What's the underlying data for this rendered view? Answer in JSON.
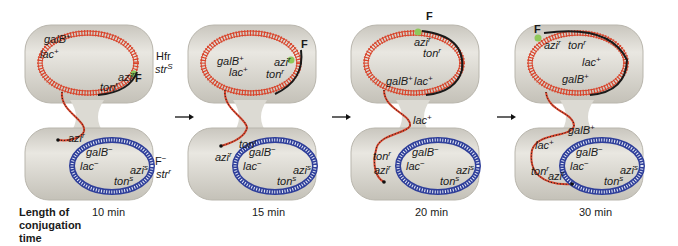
{
  "axis_label": [
    "Length of",
    "conjugation",
    "time"
  ],
  "donor_label": [
    "Hfr",
    "str",
    "S"
  ],
  "recipient_label": [
    "F",
    "−",
    "str",
    "r"
  ],
  "colors": {
    "cell_fill": "#d8d6cf",
    "cell_edge": "#b9b6ad",
    "hfr_dna": "#d9442b",
    "transferred_dna": "#1a1a1a",
    "f_factor": "#8fc85a",
    "recipient_dna": "#2f3f9a"
  },
  "panels": [
    {
      "time": "10 min",
      "donor_genes": [
        "galB+",
        "lac+",
        "azi r",
        "ton r",
        "F"
      ],
      "transferred_genes": [
        "azi r"
      ],
      "recipient_genes": [
        "galB−",
        "lac−",
        "azi s",
        "ton s"
      ]
    },
    {
      "time": "15 min",
      "donor_genes": [
        "galB+",
        "lac+",
        "azi r",
        "ton r",
        "F"
      ],
      "transferred_genes": [
        "ton r",
        "azi r"
      ],
      "recipient_genes": [
        "galB−",
        "lac−",
        "azi s",
        "ton s"
      ]
    },
    {
      "time": "20 min",
      "donor_genes": [
        "F",
        "azi r",
        "ton r",
        "galB+",
        "lac+"
      ],
      "transferred_genes": [
        "lac+",
        "ton r",
        "azi r"
      ],
      "recipient_genes": [
        "galB−",
        "lac−",
        "azi s",
        "ton s"
      ]
    },
    {
      "time": "30 min",
      "donor_genes": [
        "F",
        "azi r",
        "ton r",
        "lac+",
        "galB+"
      ],
      "transferred_genes": [
        "galB+",
        "lac+",
        "ton r",
        "azi r"
      ],
      "recipient_genes": [
        "galB−",
        "lac−",
        "azi s",
        "ton s"
      ]
    }
  ]
}
